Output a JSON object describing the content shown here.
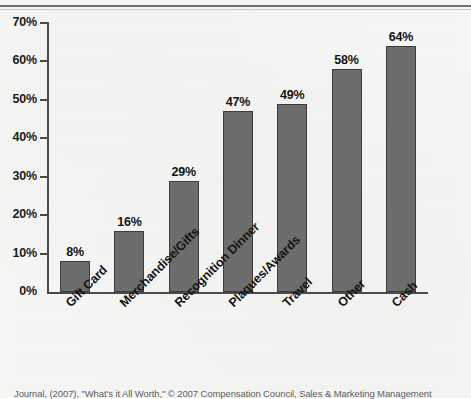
{
  "chart_data": {
    "type": "bar",
    "title": "",
    "subtitle": "",
    "xlabel": "",
    "ylabel": "",
    "categories": [
      "Gift Card",
      "Merchandise/Gifts",
      "Recognition Dinner",
      "Plaques/Awards",
      "Travel",
      "Other",
      "Cash"
    ],
    "values": [
      8,
      16,
      29,
      47,
      49,
      58,
      64
    ],
    "value_labels": [
      "8%",
      "16%",
      "29%",
      "47%",
      "49%",
      "58%",
      "64%"
    ],
    "ylim": [
      0,
      70
    ],
    "ytick_values": [
      0,
      10,
      20,
      30,
      40,
      50,
      60,
      70
    ],
    "ytick_labels": [
      "0%",
      "10%",
      "20%",
      "30%",
      "40%",
      "50%",
      "60%",
      "70%"
    ],
    "grid": false,
    "legend": false,
    "legend_position": "none",
    "bar_color": "#6d6d6d",
    "bar_edge_color": "#3c3c3c",
    "axis_color": "#4a4a4a",
    "text_color": "#141414",
    "background_color": "#f5f5f4",
    "xtick_label_rotation": -45
  },
  "caption": {
    "text": "Journal, (2007), \"What's it All Worth,\" © 2007 Compensation Council, Sales & Marketing Management"
  }
}
